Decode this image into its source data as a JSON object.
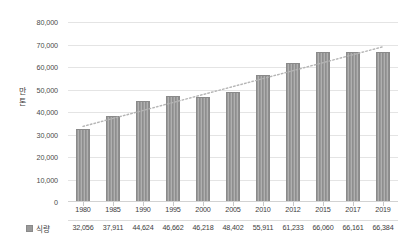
{
  "chart_data": {
    "type": "bar",
    "title": "",
    "xlabel": "",
    "ylabel": "만톤",
    "ylim": [
      0,
      80000
    ],
    "ytick_labels": [
      "80,000",
      "70,000",
      "60,000",
      "50,000",
      "40,000",
      "30,000",
      "20,000",
      "10,000",
      "0"
    ],
    "ytick_values": [
      80000,
      70000,
      60000,
      50000,
      40000,
      30000,
      20000,
      10000,
      0
    ],
    "grid": true,
    "legend_position": "bottom-left",
    "categories": [
      "1980",
      "1985",
      "1990",
      "1995",
      "2000",
      "2005",
      "2010",
      "2012",
      "2015",
      "2017",
      "2019"
    ],
    "series": [
      {
        "name": "식량",
        "values": [
          32056,
          37911,
          44624,
          46662,
          46218,
          48402,
          55911,
          61233,
          66060,
          66161,
          66384
        ],
        "value_labels": [
          "32,056",
          "37,911",
          "44,624",
          "46,662",
          "46,218",
          "48,402",
          "55,911",
          "61,233",
          "66,060",
          "66,161",
          "66,384"
        ],
        "color": "#9a9a9a"
      }
    ],
    "annotations": [
      {
        "type": "trendline",
        "style": "dotted",
        "color": "#b5b5b5",
        "start_value": 33600,
        "end_value": 69000
      }
    ]
  }
}
